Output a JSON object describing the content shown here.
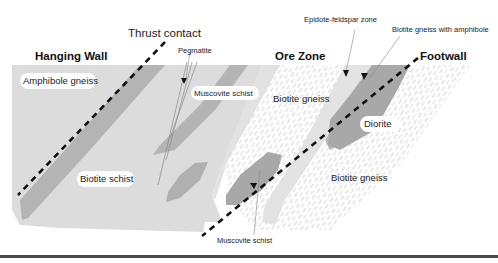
{
  "diagram": {
    "type": "geological cross-section",
    "zones": {
      "hanging_wall": "Hanging Wall",
      "ore_zone": "Ore Zone",
      "footwall": "Footwall"
    },
    "structures": {
      "thrust_contact": "Thrust contact"
    },
    "units": {
      "amphibole_gneiss": "Amphibole gneiss",
      "biotite_schist": "Biotite schist",
      "muscovite_schist_upper": "Muscovite schist",
      "muscovite_schist_lower": "Muscovite schist",
      "pegmatite": "Pegmatite",
      "biotite_gneiss_ore": "Biotite gneiss",
      "biotite_gneiss_footwall": "Biotite gneiss",
      "epidote_feldspar_zone": "Epidote-feldspar zone",
      "biotite_gneiss_with_amphibole": "Biotite gneiss with amphibole",
      "diorite": "Diorite"
    },
    "colors": {
      "light_gray": "#dcdcdc",
      "medium_gray": "#b4b4b4",
      "dark_gray": "#a6a6a6",
      "pale_gray": "#e4e4e4",
      "hatch": "#c8c8c8",
      "dash": "#111111",
      "rule": "#4a4a4a"
    }
  }
}
